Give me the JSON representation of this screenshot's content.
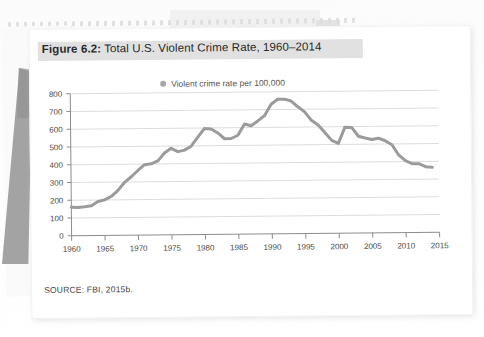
{
  "figure": {
    "label": "Figure 6.2:",
    "title": " Total U.S. Violent Crime Rate, 1960–2014",
    "source": "SOURCE: FBI, 2015b.",
    "legend_label": "Violent crime rate per 100,000",
    "legend_marker": "circle-marker-icon",
    "line_color": "#9b9b9b",
    "grid_color": "#dddddd",
    "axis_color": "#8c8c8c",
    "highlight_color": "#dcdcdc"
  },
  "chart_data": {
    "type": "line",
    "title": "Total U.S. Violent Crime Rate, 1960–2014",
    "xlabel": "",
    "ylabel": "",
    "xlim": [
      1960,
      2015
    ],
    "ylim": [
      0,
      800
    ],
    "grid": true,
    "legend_position": "top-center",
    "xticks": [
      1960,
      1965,
      1970,
      1975,
      1980,
      1985,
      1990,
      1995,
      2000,
      2005,
      2010,
      2015
    ],
    "yticks": [
      0,
      100,
      200,
      300,
      400,
      500,
      600,
      700,
      800
    ],
    "series": [
      {
        "name": "Violent crime rate per 100,000",
        "x": [
          1960,
          1961,
          1962,
          1963,
          1964,
          1965,
          1966,
          1967,
          1968,
          1969,
          1970,
          1971,
          1972,
          1973,
          1974,
          1975,
          1976,
          1977,
          1978,
          1979,
          1980,
          1981,
          1982,
          1983,
          1984,
          1985,
          1986,
          1987,
          1988,
          1989,
          1990,
          1991,
          1992,
          1993,
          1994,
          1995,
          1996,
          1997,
          1998,
          1999,
          2000,
          2001,
          2002,
          2003,
          2004,
          2005,
          2006,
          2007,
          2008,
          2009,
          2010,
          2011,
          2012,
          2013,
          2014
        ],
        "values": [
          161,
          158,
          162,
          168,
          191,
          200,
          220,
          253,
          298,
          329,
          364,
          396,
          401,
          417,
          461,
          487,
          468,
          476,
          498,
          549,
          597,
          594,
          571,
          538,
          539,
          557,
          620,
          610,
          637,
          666,
          730,
          758,
          758,
          747,
          714,
          685,
          637,
          611,
          568,
          523,
          506,
          597,
          595,
          545,
          535,
          526,
          533,
          518,
          495,
          437,
          405,
          387,
          387,
          370,
          366
        ]
      }
    ]
  }
}
